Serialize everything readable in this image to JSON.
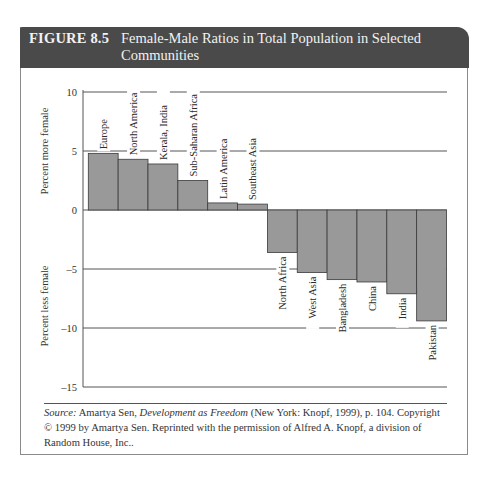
{
  "figure": {
    "number": "FIGURE 8.5",
    "title": "Female-Male Ratios in Total Population in Selected Communities"
  },
  "source": {
    "label": "Source:",
    "author": " Amartya Sen, ",
    "book": "Development as Freedom",
    "rest": " (New York: Knopf, 1999), p. 104. Copyright © 1999 by Amartya Sen. Reprinted with the permission of Alfred A. Knopf, a division of Random House, Inc.."
  },
  "colors": {
    "header_bg": "#4a4a4a",
    "bar_fill": "#999999",
    "bar_stroke": "#3a3a3a",
    "grid": "#555555"
  },
  "chart_data": {
    "type": "bar",
    "title": "Female-Male Ratios in Total Population in Selected Communities",
    "xlabel": "",
    "ylabel_top": "Percent more female",
    "ylabel_bottom": "Percent less female",
    "categories": [
      "Europe",
      "North America",
      "Kerala, India",
      "Sub-Saharan Africa",
      "Latin America",
      "Southeast Asia",
      "North Africa",
      "West Asia",
      "Bangladesh",
      "China",
      "India",
      "Pakistan"
    ],
    "values": [
      4.8,
      4.3,
      3.9,
      2.5,
      0.6,
      0.5,
      -3.6,
      -5.3,
      -5.9,
      -6.1,
      -7.1,
      -9.4
    ],
    "ylim": [
      -15,
      10
    ],
    "yticks": [
      10,
      5,
      0,
      -5,
      -10,
      -15
    ],
    "ytick_labels": [
      "10",
      "5",
      "0",
      "–5",
      "–10",
      "–15"
    ],
    "grid": true,
    "legend": null
  }
}
